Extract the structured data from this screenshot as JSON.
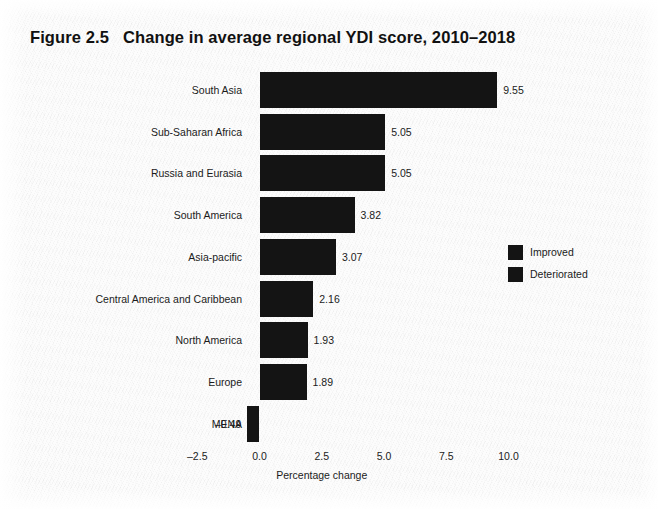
{
  "figure": {
    "title": "Figure 2.5   Change in average regional YDI score, 2010–2018"
  },
  "chart_data": {
    "type": "bar",
    "orientation": "horizontal",
    "title": "Figure 2.5   Change in average regional YDI score, 2010–2018",
    "xlabel": "Percentage change",
    "ylabel": "",
    "categories": [
      "South Asia",
      "Sub-Saharan Africa",
      "Russia and Eurasia",
      "South America",
      "Asia-pacific",
      "Central America and Caribbean",
      "North America",
      "Europe",
      "MENA"
    ],
    "values": [
      9.55,
      5.05,
      5.05,
      3.82,
      3.07,
      2.16,
      1.93,
      1.89,
      -0.49
    ],
    "value_labels": [
      "9.55",
      "5.05",
      "5.05",
      "3.82",
      "3.07",
      "2.16",
      "1.93",
      "1.89",
      "–0.49"
    ],
    "xticks": [
      -2.5,
      0.0,
      2.5,
      5.0,
      7.5,
      10.0
    ],
    "xtick_labels": [
      "–2.5",
      "0.0",
      "2.5",
      "5.0",
      "7.5",
      "10.0"
    ],
    "xlim": [
      -3.6,
      10.8
    ],
    "grid": false,
    "bar_color": "#141414",
    "legend": {
      "position": "right-middle",
      "entries": [
        {
          "label": "Improved",
          "color": "#141414"
        },
        {
          "label": "Deteriorated",
          "color": "#141414"
        }
      ]
    }
  }
}
